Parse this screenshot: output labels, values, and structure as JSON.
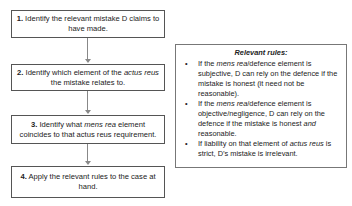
{
  "steps": [
    {
      "num": "1.",
      "text_parts": [
        " Identify the relevant mistake D claims to have made."
      ]
    },
    {
      "num": "2.",
      "pre": " Identify which element of the ",
      "italic": "actus reus",
      "post": " the mistake relates to."
    },
    {
      "num": "3.",
      "pre": " Identify what ",
      "italic": "mens rea",
      "post": " element coincides to that actus reus requirement."
    },
    {
      "num": "4.",
      "text": " Apply the relevant rules to the case at hand."
    }
  ],
  "rules": {
    "title": "Relevant rules:",
    "bullet": "•",
    "items": [
      {
        "pre": "If the ",
        "italic": "mens rea",
        "post": "/defence element is subjective, D can rely on the defence if the mistake is honest (it need not be reasonable)."
      },
      {
        "pre": "If the ",
        "italic": "mens rea",
        "post": "/defence element is objective/negligence, D can rely on the defence if the mistake is honest ",
        "italic2": "and",
        "post2": " reasonable."
      },
      {
        "pre": "If liability on that element of ",
        "italic": "actus reus",
        "post": " is strict, D’s mistake is irrelevant."
      }
    ]
  }
}
